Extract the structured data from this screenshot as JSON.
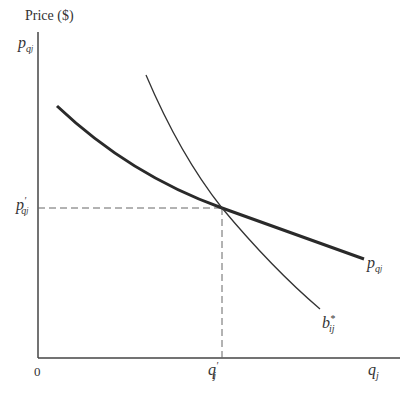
{
  "axes": {
    "y_label": "Price ($)",
    "x_origin": "0",
    "y_top_tick": {
      "base": "p",
      "sub": "q",
      "subsub": "j"
    },
    "y_mid_tick": {
      "base": "p",
      "prime": "′",
      "sub": "q",
      "subsub": "j"
    },
    "x_mid_tick": {
      "base": "q",
      "prime": "′",
      "sub": "j"
    },
    "x_end_tick": {
      "base": "q",
      "sub": "j"
    }
  },
  "curves": [
    {
      "name": "price curve",
      "label": {
        "base": "p",
        "sub": "q",
        "subsub": "j"
      },
      "style": "thick",
      "color": "#2a2a2a"
    },
    {
      "name": "bid curve",
      "label": {
        "base": "b",
        "sup": "*",
        "sub": "ij"
      },
      "style": "thin",
      "color": "#333333"
    }
  ],
  "equilibrium": {
    "x": "q′j",
    "y": "p′qj",
    "guides": "dashed"
  },
  "colors": {
    "axis": "#444444",
    "dash": "#666666"
  }
}
